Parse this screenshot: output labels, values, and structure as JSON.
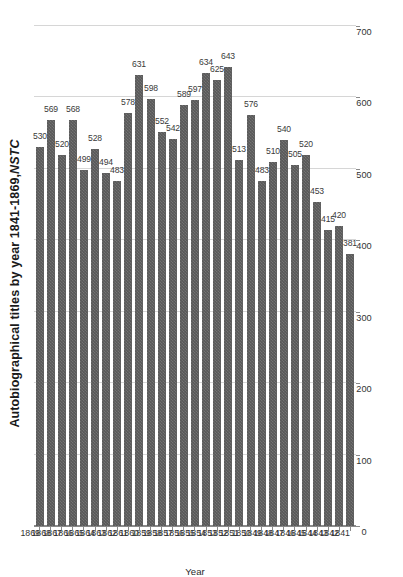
{
  "chart_data": {
    "type": "bar",
    "orientation": "horizontal",
    "title_plain": "Autobiographical titles by year 1841-1869,",
    "title_italic": "NSTC",
    "xlabel": "",
    "ylabel": "Year",
    "ylim": [
      0,
      700
    ],
    "grid": true,
    "legend": "none",
    "value_ticks": [
      0,
      100,
      200,
      300,
      400,
      500,
      600,
      700
    ],
    "value_tick_labels": [
      "0",
      "100",
      "200",
      "300",
      "400",
      "500",
      "600",
      "700"
    ],
    "categories": [
      "1841",
      "1842",
      "1843",
      "1844",
      "1845",
      "1846",
      "1847",
      "1848",
      "1849",
      "1850",
      "1851",
      "1852",
      "1853",
      "1854",
      "1855",
      "1856",
      "1857",
      "1858",
      "1859",
      "1860",
      "1861",
      "1862",
      "1863",
      "1864",
      "1865",
      "1866",
      "1867",
      "1868",
      "1869"
    ],
    "values": [
      381,
      420,
      415,
      453,
      520,
      505,
      540,
      510,
      483,
      576,
      513,
      643,
      625,
      634,
      597,
      589,
      542,
      552,
      598,
      631,
      578,
      483,
      494,
      528,
      499,
      568,
      520,
      569,
      530
    ],
    "data_labels": [
      "381",
      "420",
      "415",
      "453",
      "520",
      "505",
      "540",
      "510",
      "483",
      "576",
      "513",
      "643",
      "625",
      "634",
      "597",
      "589",
      "542",
      "552",
      "598",
      "631",
      "578",
      "483",
      "494",
      "528",
      "499",
      "568",
      "520",
      "569",
      "530"
    ],
    "bar_color": "#595959",
    "gridline_color": "#d6d6d6",
    "axis_color": "#8a8a8a"
  }
}
